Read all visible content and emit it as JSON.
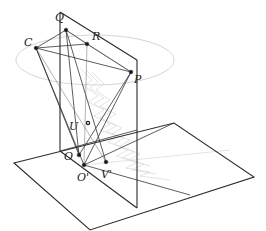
{
  "diagram": {
    "type": "3d-geometry-projection",
    "colors": {
      "frame": "#2a2a2a",
      "lines": "#333333",
      "ellipse": "#d6d6d6",
      "shading": "#dcdcdc",
      "background": "#ffffff"
    },
    "planes": {
      "vertical": {
        "name": "vertical-plane"
      },
      "ground": {
        "name": "ground-plane"
      }
    },
    "points": [
      {
        "id": "Q",
        "label": "Q",
        "x": 60,
        "y": 12,
        "lx": 55,
        "ly": 17
      },
      {
        "id": "T",
        "label": "",
        "x": 66,
        "y": 30
      },
      {
        "id": "C",
        "label": "C",
        "x": 36,
        "y": 48,
        "lx": 24,
        "ly": 46
      },
      {
        "id": "R",
        "label": "R",
        "x": 87,
        "y": 44,
        "lx": 92,
        "ly": 40
      },
      {
        "id": "P",
        "label": "P",
        "x": 131,
        "y": 72,
        "lx": 134,
        "ly": 82
      },
      {
        "id": "U",
        "label": "U",
        "x": 88,
        "y": 123,
        "lx": 69,
        "ly": 130
      },
      {
        "id": "O",
        "label": "O",
        "x": 79,
        "y": 155,
        "lx": 64,
        "ly": 159
      },
      {
        "id": "O_prime",
        "label": "O'",
        "x": 84,
        "y": 165,
        "lx": 77,
        "ly": 180
      },
      {
        "id": "V_prime",
        "label": "V'",
        "x": 106,
        "y": 162,
        "lx": 101,
        "ly": 178
      }
    ]
  }
}
